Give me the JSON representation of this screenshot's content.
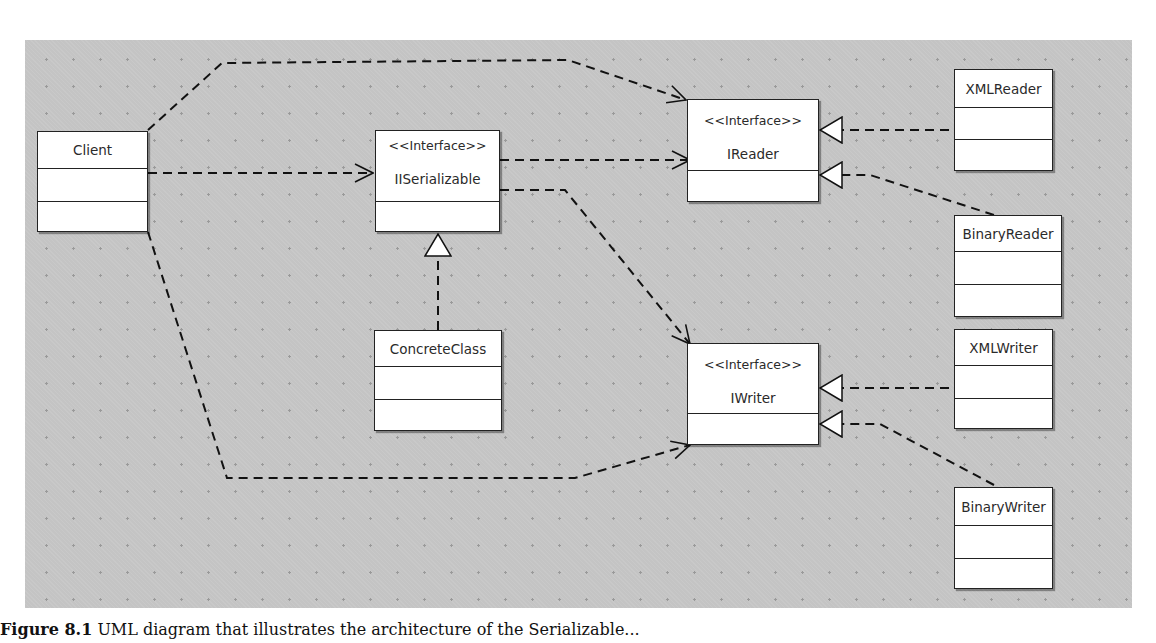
{
  "diagram": {
    "type": "UML class diagram",
    "classes": [
      {
        "id": "client",
        "name": "Client",
        "stereotype": null
      },
      {
        "id": "iserializable",
        "name": "IISerializable",
        "stereotype": "<<Interface>>"
      },
      {
        "id": "concrete",
        "name": "ConcreteClass",
        "stereotype": null
      },
      {
        "id": "ireader",
        "name": "IReader",
        "stereotype": "<<Interface>>"
      },
      {
        "id": "iwriter",
        "name": "IWriter",
        "stereotype": "<<Interface>>"
      },
      {
        "id": "xmlreader",
        "name": "XMLReader",
        "stereotype": null
      },
      {
        "id": "binaryreader",
        "name": "BinaryReader",
        "stereotype": null
      },
      {
        "id": "xmlwriter",
        "name": "XMLWriter",
        "stereotype": null
      },
      {
        "id": "binarywriter",
        "name": "BinaryWriter",
        "stereotype": null
      }
    ],
    "relations": [
      {
        "from": "Client",
        "to": "IReader",
        "kind": "dependency"
      },
      {
        "from": "Client",
        "to": "IISerializable",
        "kind": "dependency"
      },
      {
        "from": "Client",
        "to": "IWriter",
        "kind": "dependency"
      },
      {
        "from": "IISerializable",
        "to": "IReader",
        "kind": "dependency"
      },
      {
        "from": "IISerializable",
        "to": "IWriter",
        "kind": "dependency"
      },
      {
        "from": "ConcreteClass",
        "to": "IISerializable",
        "kind": "realization"
      },
      {
        "from": "XMLReader",
        "to": "IReader",
        "kind": "realization"
      },
      {
        "from": "BinaryReader",
        "to": "IReader",
        "kind": "realization"
      },
      {
        "from": "XMLWriter",
        "to": "IWriter",
        "kind": "realization"
      },
      {
        "from": "BinaryWriter",
        "to": "IWriter",
        "kind": "realization"
      }
    ]
  },
  "caption": {
    "label": "Figure 8.1",
    "text": "UML diagram that illustrates the architecture of the Serializable..."
  }
}
